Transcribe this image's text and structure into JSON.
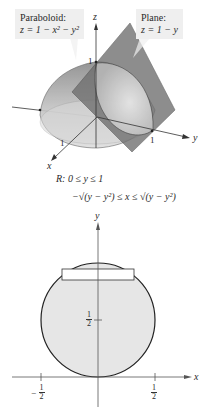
{
  "figure_3d": {
    "paraboloid_label": {
      "title": "Paraboloid:",
      "equation": "z = 1 − x² − y²"
    },
    "plane_label": {
      "title": "Plane:",
      "equation": "z = 1 − y"
    },
    "axes": {
      "z_label": "z",
      "y_label": "y",
      "x_label": "x",
      "z_tick": "1",
      "y_tick": "1",
      "x_tick": "1"
    },
    "colors": {
      "paraboloid_fill": "#b8b8b8",
      "plane_fill": "#6e6e6e",
      "callout_bg": "#efefef"
    }
  },
  "region": {
    "line1": "R:  0 ≤ y ≤ 1",
    "line2": "−√(y − y²) ≤ x ≤ √(y − y²)"
  },
  "figure_2d": {
    "axes": {
      "x_label": "x",
      "y_label": "y"
    },
    "ticks": {
      "y_half": {
        "num": "1",
        "den": "2"
      },
      "x_neg_half": {
        "sign": "−",
        "num": "1",
        "den": "2"
      },
      "x_pos_half": {
        "num": "1",
        "den": "2"
      }
    },
    "colors": {
      "disk_fill": "#e6e6e6",
      "circle_stroke": "#222222",
      "strip_fill": "#ffffff"
    }
  }
}
